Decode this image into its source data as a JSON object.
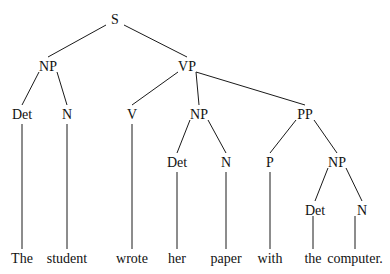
{
  "diagram": {
    "type": "syntax-tree",
    "sentence": "The student wrote her paper with the computer.",
    "nodes": [
      {
        "id": "s",
        "label": "S",
        "x": 115,
        "y": 24
      },
      {
        "id": "np1",
        "label": "NP",
        "x": 48,
        "y": 71
      },
      {
        "id": "vp",
        "label": "VP",
        "x": 187,
        "y": 71
      },
      {
        "id": "det1",
        "label": "Det",
        "x": 22,
        "y": 119
      },
      {
        "id": "n1",
        "label": "N",
        "x": 67,
        "y": 119
      },
      {
        "id": "v",
        "label": "V",
        "x": 132,
        "y": 119
      },
      {
        "id": "np2",
        "label": "NP",
        "x": 199,
        "y": 119
      },
      {
        "id": "pp",
        "label": "PP",
        "x": 305,
        "y": 119
      },
      {
        "id": "det2",
        "label": "Det",
        "x": 177,
        "y": 167
      },
      {
        "id": "n2",
        "label": "N",
        "x": 226,
        "y": 167
      },
      {
        "id": "p",
        "label": "P",
        "x": 270,
        "y": 167
      },
      {
        "id": "np3",
        "label": "NP",
        "x": 337,
        "y": 167
      },
      {
        "id": "det3",
        "label": "Det",
        "x": 315,
        "y": 215
      },
      {
        "id": "n3",
        "label": "N",
        "x": 362,
        "y": 215
      }
    ],
    "words": [
      {
        "id": "w1",
        "label": "The",
        "x": 22,
        "y": 263
      },
      {
        "id": "w2",
        "label": "student",
        "x": 67,
        "y": 263
      },
      {
        "id": "w3",
        "label": "wrote",
        "x": 132,
        "y": 263
      },
      {
        "id": "w4",
        "label": "her",
        "x": 177,
        "y": 263
      },
      {
        "id": "w5",
        "label": "paper",
        "x": 226,
        "y": 263
      },
      {
        "id": "w6",
        "label": "with",
        "x": 270,
        "y": 263
      },
      {
        "id": "w7",
        "label": "the",
        "x": 313,
        "y": 263
      },
      {
        "id": "w8",
        "label": "computer.",
        "x": 355,
        "y": 263
      }
    ],
    "edges": [
      [
        "s",
        "np1"
      ],
      [
        "s",
        "vp"
      ],
      [
        "np1",
        "det1"
      ],
      [
        "np1",
        "n1"
      ],
      [
        "vp",
        "v"
      ],
      [
        "vp",
        "np2"
      ],
      [
        "vp",
        "pp"
      ],
      [
        "np2",
        "det2"
      ],
      [
        "np2",
        "n2"
      ],
      [
        "pp",
        "p"
      ],
      [
        "pp",
        "np3"
      ],
      [
        "np3",
        "det3"
      ],
      [
        "np3",
        "n3"
      ],
      [
        "det1",
        "w1"
      ],
      [
        "n1",
        "w2"
      ],
      [
        "v",
        "w3"
      ],
      [
        "det2",
        "w4"
      ],
      [
        "n2",
        "w5"
      ],
      [
        "p",
        "w6"
      ],
      [
        "det3",
        "w7"
      ],
      [
        "n3",
        "w8"
      ]
    ]
  }
}
